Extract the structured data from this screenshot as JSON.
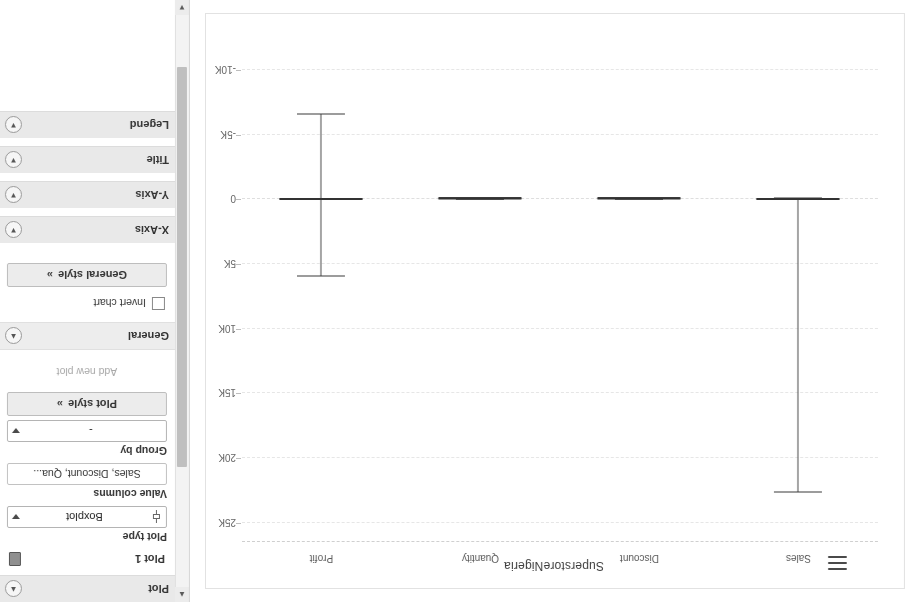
{
  "app": {
    "chart_menu_icon": "hamburger-menu-icon"
  },
  "chart": {
    "title": "SuperstoreNigeria"
  },
  "sidebar": {
    "sections": [
      {
        "id": "plot",
        "label": "Plot",
        "chevron": "chevron-up-icon"
      },
      {
        "id": "general",
        "label": "General",
        "chevron": "chevron-up-icon"
      },
      {
        "id": "x-axis",
        "label": "X-Axis",
        "chevron": "chevron-down-icon"
      },
      {
        "id": "y-axis",
        "label": "Y-Axis",
        "chevron": "chevron-down-icon"
      },
      {
        "id": "title",
        "label": "Title",
        "chevron": "chevron-down-icon"
      },
      {
        "id": "legend",
        "label": "Legend",
        "chevron": "chevron-down-icon"
      }
    ],
    "plot": {
      "item_label": "Plot 1",
      "delete_icon": "trash-icon",
      "plot_type_label": "Plot type",
      "plot_type_value": "Boxplot",
      "plot_type_icon": "boxplot-icon",
      "value_columns_label": "Value columns",
      "value_columns_value": "Sales, Discount, Qua...",
      "group_by_label": "Group by",
      "group_by_value": "-",
      "add_new_plot": "Add new plot",
      "plot_style_button": "Plot style",
      "plot_style_icon": "double-chevron-right-icon"
    },
    "general": {
      "invert_chart_label": "Invert chart",
      "invert_chart_checked": false,
      "general_style_button": "General style",
      "general_style_icon": "double-chevron-right-icon"
    },
    "scrollbar": {
      "up_arrow_icon": "chevron-up-icon",
      "down_arrow_icon": "chevron-down-icon"
    }
  },
  "chart_data": {
    "type": "boxplot",
    "title": "SuperstoreNigeria",
    "xlabel": "",
    "ylabel": "",
    "ylim": [
      -11000,
      26500
    ],
    "grid": true,
    "legend": "none",
    "yticks": [
      -10000,
      -5000,
      0,
      5000,
      10000,
      15000,
      20000,
      25000
    ],
    "ytick_labels": [
      "-10K",
      "-5K",
      "0",
      "5K",
      "10K",
      "15K",
      "20K",
      "25K"
    ],
    "categories": [
      "Sales",
      "Discount",
      "Quantity",
      "Profit"
    ],
    "boxes": [
      {
        "name": "Sales",
        "whisker_low": -120,
        "q1": -40,
        "median": 0,
        "q3": 60,
        "whisker_high": 22638
      },
      {
        "name": "Discount",
        "whisker_low": 0,
        "q1": 0,
        "median": 0,
        "q3": 0.2,
        "whisker_high": 0.8
      },
      {
        "name": "Quantity",
        "whisker_low": 1,
        "q1": 2,
        "median": 3,
        "q3": 5,
        "whisker_high": 14
      },
      {
        "name": "Profit",
        "whisker_low": -6600,
        "q1": -30,
        "median": 8,
        "q3": 60,
        "whisker_high": 5940
      }
    ]
  }
}
